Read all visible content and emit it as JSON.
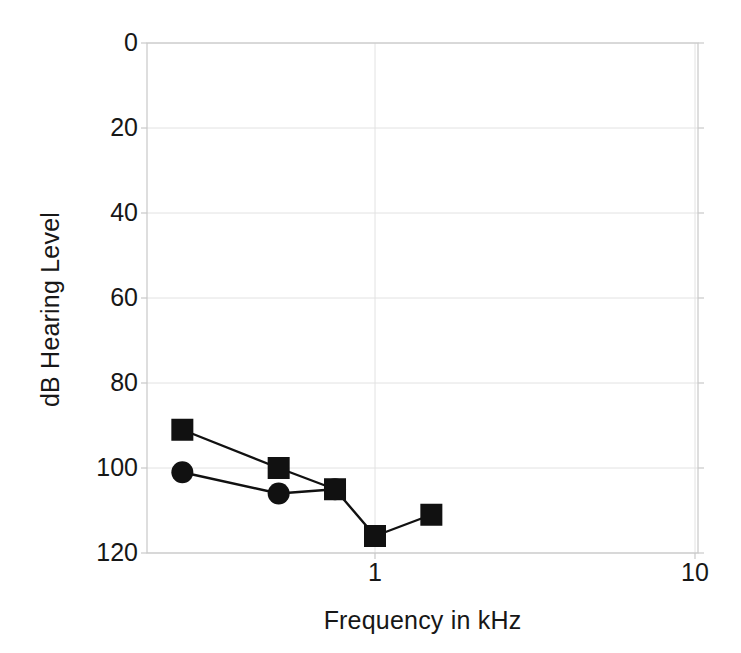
{
  "chart_data": {
    "type": "line",
    "title": "",
    "xlabel": "Frequency in kHz",
    "ylabel": "dB Hearing Level",
    "xscale": "log",
    "xlim": [
      0.2,
      10
    ],
    "ylim": [
      0,
      120
    ],
    "y_inverted": true,
    "grid": true,
    "legend_position": "none",
    "xticks": [
      {
        "value": 1,
        "label": "1"
      },
      {
        "value": 10,
        "label": "10"
      }
    ],
    "yticks": [
      {
        "value": 0,
        "label": "0"
      },
      {
        "value": 20,
        "label": "20"
      },
      {
        "value": 40,
        "label": "40"
      },
      {
        "value": 60,
        "label": "60"
      },
      {
        "value": 80,
        "label": "80"
      },
      {
        "value": 100,
        "label": "100"
      },
      {
        "value": 120,
        "label": "120"
      }
    ],
    "series": [
      {
        "name": "square-series",
        "marker": "square",
        "color": "#111111",
        "x": [
          0.25,
          0.5,
          0.75,
          1.0,
          1.5
        ],
        "values": [
          91,
          100,
          105,
          116,
          111
        ]
      },
      {
        "name": "circle-series",
        "marker": "circle",
        "color": "#111111",
        "x": [
          0.25,
          0.5,
          0.75
        ],
        "values": [
          101,
          106,
          105
        ]
      }
    ]
  },
  "figure": {
    "background_color": "#ffffff",
    "axis_color": "#c9c9c9",
    "grid_color": "#e2e2e2",
    "text_color": "#171717"
  }
}
